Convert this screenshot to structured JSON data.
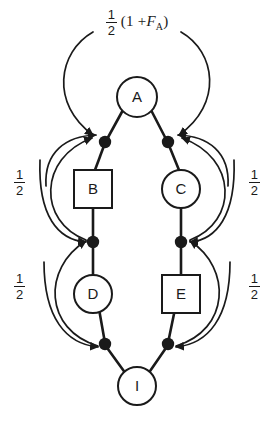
{
  "figure": {
    "type": "pedigree-path-diagram",
    "background_color": "#ffffff",
    "stroke_color": "#1a1a1a"
  },
  "top_label": {
    "coefficient_numerator": "1",
    "coefficient_denominator": "2",
    "expression_open": "(1 +",
    "expression_symbol": "F",
    "expression_subscript": "A",
    "expression_close": ")",
    "full_text": "1/2 (1 + F_A)"
  },
  "nodes": [
    {
      "id": "A",
      "label": "A",
      "shape": "circle",
      "cx": 137,
      "cy": 97,
      "r": 20
    },
    {
      "id": "B",
      "label": "B",
      "shape": "square",
      "cx": 93,
      "cy": 189,
      "size": 38
    },
    {
      "id": "C",
      "label": "C",
      "shape": "circle",
      "cx": 181,
      "cy": 189,
      "r": 19
    },
    {
      "id": "D",
      "label": "D",
      "shape": "circle",
      "cx": 93,
      "cy": 294,
      "r": 19
    },
    {
      "id": "E",
      "label": "E",
      "shape": "square",
      "cx": 181,
      "cy": 294,
      "size": 38
    },
    {
      "id": "I",
      "label": "I",
      "shape": "circle",
      "cx": 137,
      "cy": 386,
      "r": 19
    }
  ],
  "junction_dots": [
    {
      "id": "j-left-upper",
      "cx": 105,
      "cy": 142
    },
    {
      "id": "j-right-upper",
      "cx": 168,
      "cy": 142
    },
    {
      "id": "j-left-mid",
      "cx": 93,
      "cy": 242
    },
    {
      "id": "j-right-mid",
      "cx": 181,
      "cy": 242
    },
    {
      "id": "j-left-lower",
      "cx": 105,
      "cy": 344
    },
    {
      "id": "j-right-lower",
      "cx": 168,
      "cy": 344
    }
  ],
  "path_coefficients": [
    {
      "id": "left-upper",
      "numerator": "1",
      "denominator": "2",
      "text": "1/2"
    },
    {
      "id": "right-upper",
      "numerator": "1",
      "denominator": "2",
      "text": "1/2"
    },
    {
      "id": "left-lower",
      "numerator": "1",
      "denominator": "2",
      "text": "1/2"
    },
    {
      "id": "right-lower",
      "numerator": "1",
      "denominator": "2",
      "text": "1/2"
    }
  ],
  "edges": [
    {
      "from": "A",
      "to": "j-left-upper"
    },
    {
      "from": "A",
      "to": "j-right-upper"
    },
    {
      "from": "j-left-upper",
      "to": "B"
    },
    {
      "from": "j-right-upper",
      "to": "C"
    },
    {
      "from": "B",
      "to": "j-left-mid"
    },
    {
      "from": "C",
      "to": "j-right-mid"
    },
    {
      "from": "j-left-mid",
      "to": "D"
    },
    {
      "from": "j-right-mid",
      "to": "E"
    },
    {
      "from": "D",
      "to": "j-left-lower"
    },
    {
      "from": "E",
      "to": "j-right-lower"
    },
    {
      "from": "j-left-lower",
      "to": "I"
    },
    {
      "from": "j-right-lower",
      "to": "I"
    }
  ]
}
